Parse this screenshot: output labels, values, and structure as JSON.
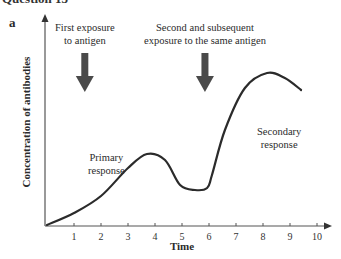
{
  "heading_partial": "Question 13",
  "panel_label": "a",
  "chart_data": {
    "type": "line",
    "title": "",
    "xlabel": "Time",
    "ylabel": "Concentration of antibodies",
    "xlim": [
      0,
      10.5
    ],
    "ylim": [
      0,
      10.3
    ],
    "x_ticks": [
      1,
      2,
      3,
      4,
      5,
      6,
      7,
      8,
      9,
      10
    ],
    "y_ticks": [],
    "grid": false,
    "series": [
      {
        "name": "Antibody concentration",
        "color": "#2b2b2b",
        "x": [
          0,
          1,
          2,
          3,
          3.7,
          4.37,
          4.93,
          5.48,
          5.93,
          6.11,
          6.59,
          7.33,
          8.15,
          8.81,
          9.41
        ],
        "y": [
          0,
          0.6,
          1.45,
          2.85,
          3.55,
          3.25,
          2.0,
          1.75,
          1.85,
          2.5,
          4.75,
          6.85,
          7.6,
          7.35,
          6.75
        ]
      }
    ],
    "annotations": [
      {
        "id": "first-exposure",
        "lines": [
          "First exposure",
          "to antigen"
        ],
        "x": 1.4,
        "type": "arrow-label"
      },
      {
        "id": "second-exposure",
        "lines": [
          "Second and subsequent",
          "exposure to the same antigen"
        ],
        "x": 5.85,
        "type": "arrow-label"
      },
      {
        "id": "primary-response",
        "lines": [
          "Primary",
          "response"
        ],
        "x": 2.2,
        "y": 3.2,
        "type": "text"
      },
      {
        "id": "secondary-response",
        "lines": [
          "Secondary",
          "response"
        ],
        "x": 8.6,
        "y": 4.5,
        "type": "text"
      }
    ]
  }
}
